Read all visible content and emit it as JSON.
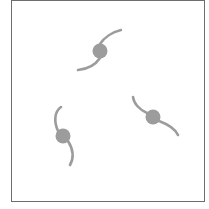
{
  "diagram": {
    "type": "three-spiral-galaxies",
    "frame": {
      "border_color": "#6e6e6e",
      "background": "#ffffff"
    },
    "galaxy_color": "#9c9c9c",
    "galaxies": [
      {
        "id": "top",
        "core": [
          100,
          51
        ],
        "core_radius": 7.5
      },
      {
        "id": "left",
        "core": [
          63,
          136
        ],
        "core_radius": 7.5
      },
      {
        "id": "right",
        "core": [
          153,
          117
        ],
        "core_radius": 7.5
      }
    ]
  }
}
